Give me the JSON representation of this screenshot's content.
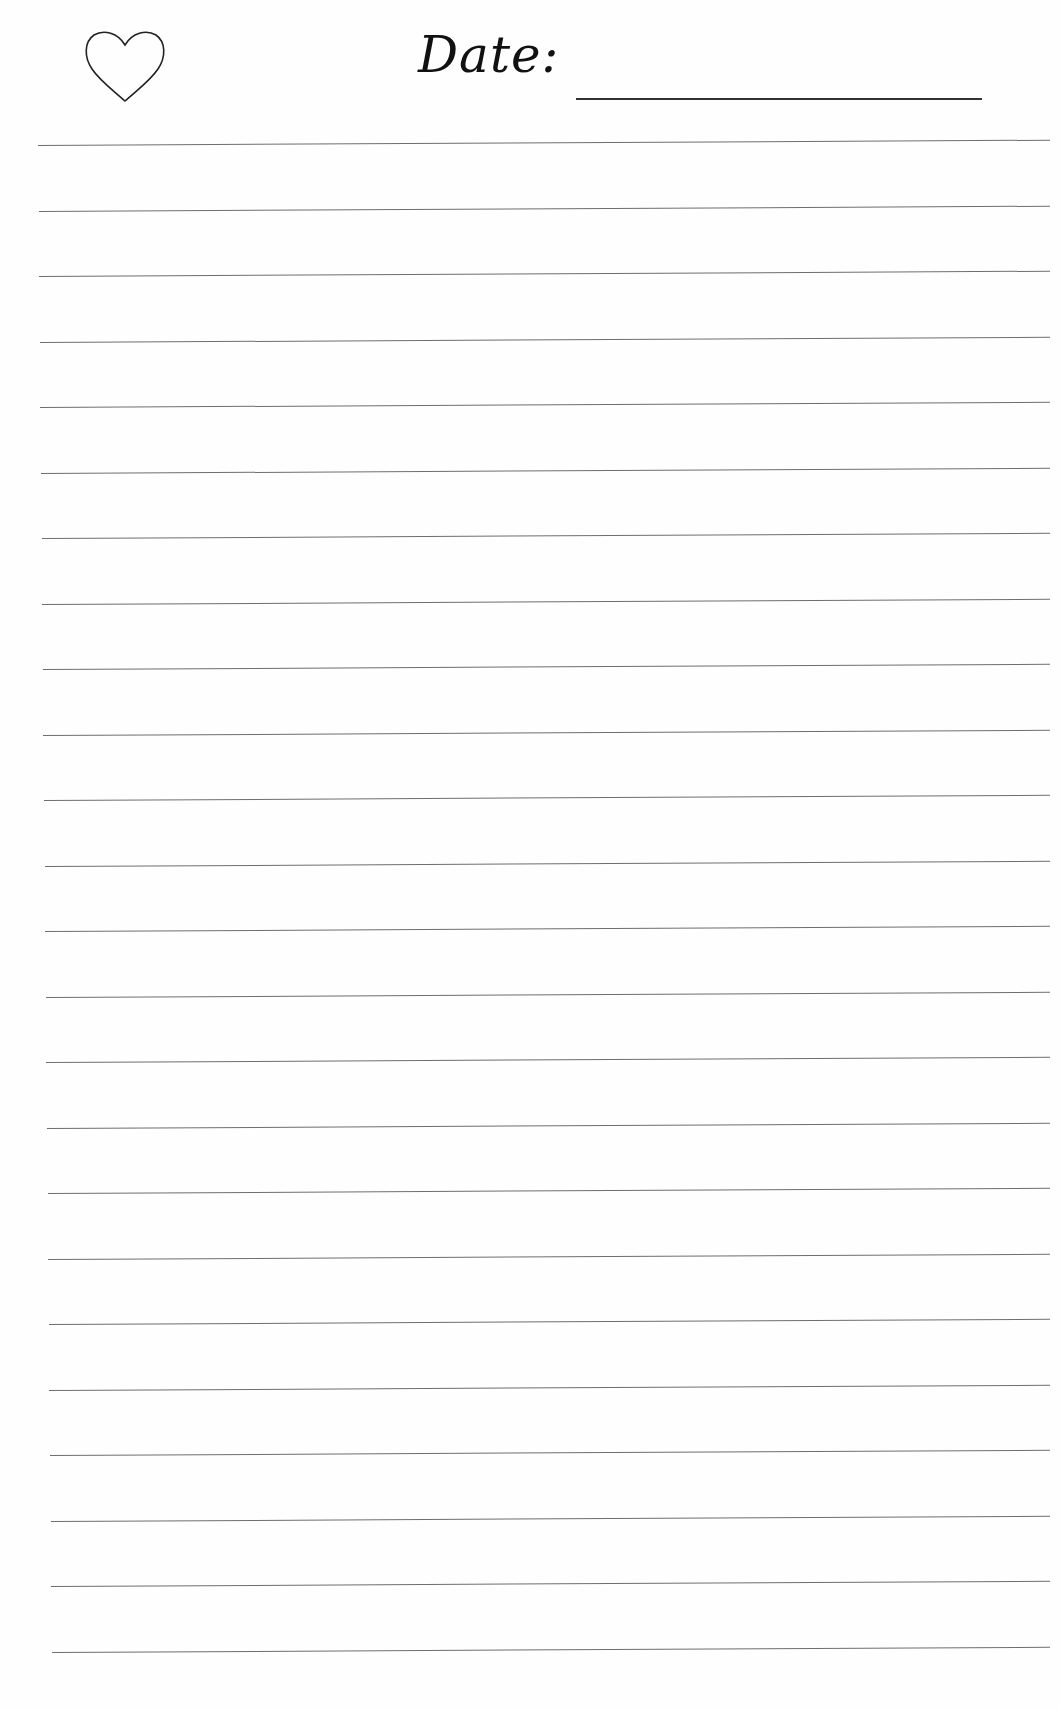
{
  "header": {
    "icon": "heart-icon",
    "date_label": "Date:",
    "date_value": ""
  },
  "ruled_lines": {
    "count": 24,
    "color": "#6e6e6e",
    "first_y": 145,
    "spacing": 65.5
  }
}
